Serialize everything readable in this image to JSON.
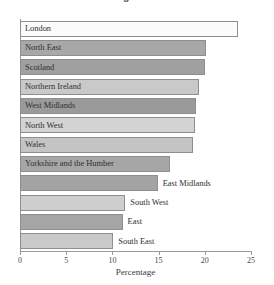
{
  "chart_data": {
    "type": "bar",
    "orientation": "horizontal",
    "title": "Percentage of Residents",
    "xlabel": "Percentage",
    "ylabel": "",
    "xlim": [
      0,
      25
    ],
    "xticks": [
      0,
      5,
      10,
      15,
      20,
      25
    ],
    "xtick_labels": [
      "0",
      "5",
      "10",
      "15",
      "20",
      "25"
    ],
    "grid": false,
    "legend": false,
    "categories": [
      "London",
      "North East",
      "Scotland",
      "Northern Ireland",
      "West Midlands",
      "North West",
      "Wales",
      "Yorkshire and the Humber",
      "East Midlands",
      "South West",
      "East",
      "South East"
    ],
    "values": [
      23.6,
      20.1,
      20.0,
      19.4,
      19.0,
      18.9,
      18.7,
      16.2,
      14.9,
      11.4,
      11.1,
      10.1
    ],
    "label_placement": [
      "inside",
      "inside",
      "inside",
      "inside",
      "inside",
      "inside",
      "inside",
      "inside",
      "outside",
      "outside",
      "outside",
      "outside"
    ],
    "bar_colors": [
      "#fbfbfb",
      "#a8a8a8",
      "#a0a0a0",
      "#c9c9c9",
      "#9a9a9a",
      "#d3d3d3",
      "#c4c4c4",
      "#a6a6a6",
      "#a3a3a3",
      "#cecece",
      "#a5a5a5",
      "#c9c9c9"
    ],
    "bar_edge_color": "#8e8e8e",
    "axis_color": "#9a9a9a",
    "text_color": "#2f2f2f",
    "background_color": "#ffffff"
  }
}
